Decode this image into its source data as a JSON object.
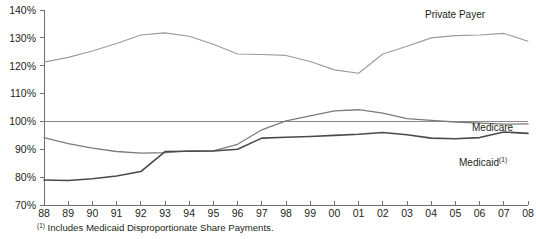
{
  "chart_data": {
    "type": "line",
    "title": "",
    "subtitle": "",
    "xlabel": "",
    "ylabel": "",
    "grid": false,
    "legend_position": "inline-right",
    "categories": [
      "88",
      "89",
      "90",
      "91",
      "92",
      "93",
      "94",
      "95",
      "96",
      "97",
      "98",
      "99",
      "00",
      "01",
      "02",
      "03",
      "04",
      "05",
      "06",
      "07",
      "08"
    ],
    "x": [
      1988,
      1989,
      1990,
      1991,
      1992,
      1993,
      1994,
      1995,
      1996,
      1997,
      1998,
      1999,
      2000,
      2001,
      2002,
      2003,
      2004,
      2005,
      2006,
      2007,
      2008
    ],
    "ylim": [
      70,
      140
    ],
    "yticks": [
      70,
      80,
      90,
      100,
      110,
      120,
      130,
      140
    ],
    "ytick_labels": [
      "70%",
      "80%",
      "90%",
      "100%",
      "110%",
      "120%",
      "130%",
      "140%"
    ],
    "reference_line": {
      "value": 100,
      "label": "100%"
    },
    "series": [
      {
        "name": "Private Payer",
        "color": "#9b9b9b",
        "width": 1.1,
        "values": [
          121.3,
          123.0,
          125.3,
          128.0,
          131.0,
          131.8,
          130.6,
          127.7,
          124.2,
          124.0,
          123.7,
          121.5,
          118.5,
          117.3,
          116.3,
          115.5,
          116.0,
          117.3,
          119.0,
          121.0,
          124.2
        ]
      },
      {
        "name": "Medicare",
        "color": "#7b7b7b",
        "width": 1.3,
        "values": [
          94.2,
          92.0,
          90.4,
          89.2,
          88.6,
          88.8,
          89.4,
          89.4,
          91.8,
          97.0,
          100.2,
          102.0,
          103.8,
          104.2,
          103.0,
          101.0,
          100.4,
          99.8,
          99.4,
          99.0,
          99.1
        ]
      },
      {
        "name": "Medicaid",
        "color": "#4a4a4a",
        "width": 1.6,
        "values": [
          79.0,
          78.8,
          79.4,
          80.4,
          82.0,
          89.2,
          89.3,
          89.4,
          90.0,
          94.0,
          94.3,
          94.6,
          95.0,
          95.4,
          96.0,
          95.2,
          94.0,
          93.8,
          94.2,
          96.2,
          95.7
        ]
      }
    ],
    "series_tail": [
      {
        "name": "Private Payer",
        "values": [
          124.2,
          127.0,
          130.0,
          130.8,
          131.0,
          131.6,
          128.8
        ]
      }
    ]
  },
  "plot": {
    "left": 44,
    "right": 528,
    "top": 10,
    "bottom": 205
  },
  "labels": {
    "private_payer": "Private Payer",
    "medicare": "Medicare",
    "medicaid": "Medicaid",
    "medicaid_superscript": "(1)"
  },
  "footnote": {
    "superscript": "(1)",
    "text": " Includes Medicaid Disproportionate Share Payments."
  },
  "colors": {
    "private_payer": "#9b9b9b",
    "medicare": "#7b7b7b",
    "medicaid": "#4a4a4a",
    "axis": "#6e6e6e",
    "reference": "#8a8a8a",
    "text": "#231f20",
    "background": "#ffffff"
  }
}
